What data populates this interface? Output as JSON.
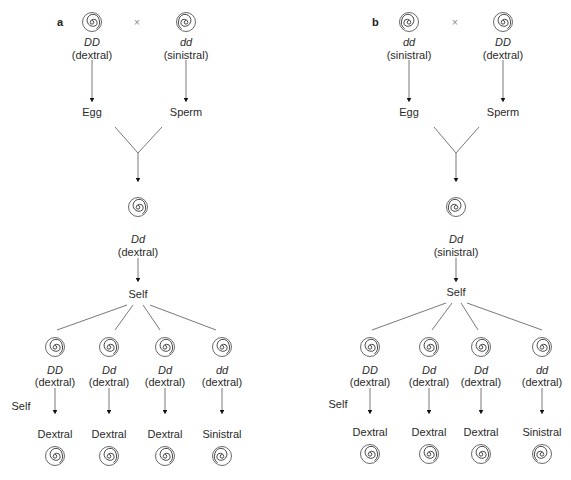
{
  "panels": [
    {
      "letter": "a",
      "cross_symbol": "×",
      "parent_left": {
        "genotype": "DD",
        "phenotype": "(dextral)",
        "gamete": "Egg",
        "coil": "dextral"
      },
      "parent_right": {
        "genotype": "dd",
        "phenotype": "(sinistral)",
        "gamete": "Sperm",
        "coil": "sinistral"
      },
      "f1": {
        "genotype": "Dd",
        "phenotype": "(dextral)",
        "coil": "dextral"
      },
      "self_label": "Self",
      "f2": [
        {
          "genotype": "DD",
          "phenotype": "(dextral)",
          "offspring": "Dextral",
          "coil": "dextral"
        },
        {
          "genotype": "Dd",
          "phenotype": "(dextral)",
          "offspring": "Dextral",
          "coil": "dextral"
        },
        {
          "genotype": "Dd",
          "phenotype": "(dextral)",
          "offspring": "Dextral",
          "coil": "dextral"
        },
        {
          "genotype": "dd",
          "phenotype": "(dextral)",
          "offspring": "Sinistral",
          "coil": "sinistral"
        }
      ],
      "f2_self_label": "Self"
    },
    {
      "letter": "b",
      "cross_symbol": "×",
      "parent_left": {
        "genotype": "dd",
        "phenotype": "(sinistral)",
        "gamete": "Egg",
        "coil": "sinistral"
      },
      "parent_right": {
        "genotype": "DD",
        "phenotype": "(dextral)",
        "gamete": "Sperm",
        "coil": "dextral"
      },
      "f1": {
        "genotype": "Dd",
        "phenotype": "(sinistral)",
        "coil": "sinistral"
      },
      "self_label": "Self",
      "f2": [
        {
          "genotype": "DD",
          "phenotype": "(dextral)",
          "offspring": "Dextral",
          "coil": "dextral"
        },
        {
          "genotype": "Dd",
          "phenotype": "(dextral)",
          "offspring": "Dextral",
          "coil": "dextral"
        },
        {
          "genotype": "Dd",
          "phenotype": "(dextral)",
          "offspring": "Dextral",
          "coil": "dextral"
        },
        {
          "genotype": "dd",
          "phenotype": "(dextral)",
          "offspring": "Sinistral",
          "coil": "sinistral"
        }
      ],
      "f2_self_label": "Self"
    }
  ]
}
